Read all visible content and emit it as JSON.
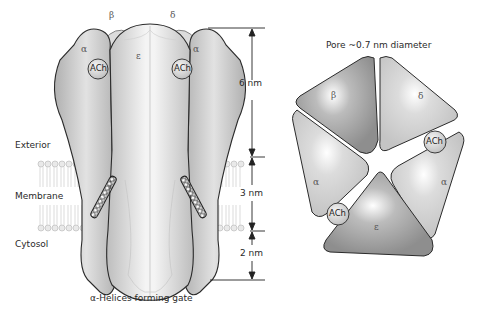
{
  "side_view": {
    "subunit_labels": {
      "top_left": "β",
      "top_right": "δ",
      "left": "α",
      "right": "α",
      "center": "ε"
    },
    "binding_sites": [
      "ACh",
      "ACh"
    ],
    "region_labels": {
      "exterior": "Exterior",
      "membrane": "Membrane",
      "cytosol": "Cytosol"
    },
    "dimensions": [
      "6 nm",
      "3 nm",
      "2 nm"
    ],
    "caption": "α-Helices forming gate"
  },
  "top_view": {
    "title": "Pore ~0.7 nm diameter",
    "subunits": [
      {
        "label": "β",
        "shade": "#9a9a9a"
      },
      {
        "label": "δ",
        "shade": "#d0d0d0"
      },
      {
        "label": "α",
        "shade": "#c8c8c8"
      },
      {
        "label": "α",
        "shade": "#c8c8c8"
      },
      {
        "label": "ε",
        "shade": "#9e9e9e"
      }
    ],
    "binding_sites": [
      "ACh",
      "ACh"
    ]
  },
  "colors": {
    "outline": "#2b2b2b",
    "light_gray": "#d9d9d9",
    "mid_gray": "#b8b8b8",
    "dark_gray": "#949494"
  }
}
